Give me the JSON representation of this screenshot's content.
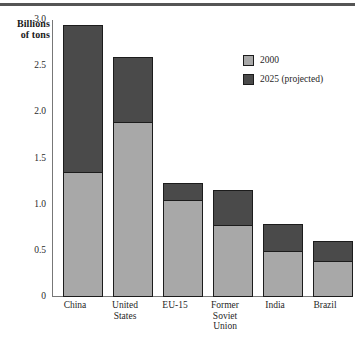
{
  "chart_data": {
    "type": "bar",
    "subtype": "stacked-vertical",
    "title": "",
    "xlabel": "",
    "ylabel": "Billions of tons",
    "ylabel_lines": [
      "Billions",
      "of tons"
    ],
    "categories": [
      "China",
      "United States",
      "EU-15",
      "Former Soviet Union",
      "India",
      "Brazil"
    ],
    "category_lines": [
      [
        "China"
      ],
      [
        "United",
        "States"
      ],
      [
        "EU-15"
      ],
      [
        "Former",
        "Soviet",
        "Union"
      ],
      [
        "India"
      ],
      [
        "Brazil"
      ]
    ],
    "series": [
      {
        "name": "2000",
        "color": "#a8a8a8",
        "values": [
          1.35,
          1.9,
          1.05,
          0.78,
          0.5,
          0.39
        ]
      },
      {
        "name": "2025 (projected)",
        "color": "#4a4a4a",
        "values": [
          1.6,
          0.7,
          0.18,
          0.38,
          0.29,
          0.22
        ]
      }
    ],
    "totals": [
      2.95,
      2.6,
      1.23,
      1.16,
      0.79,
      0.61
    ],
    "ylim": [
      0,
      3.0
    ],
    "yticks": [
      0,
      0.5,
      1.0,
      1.5,
      2.0,
      2.5,
      3.0
    ],
    "ytick_labels": [
      "0",
      "0.5",
      "1.0",
      "1.5",
      "2.0",
      "2.5",
      "3.0"
    ],
    "grid": false,
    "legend_position": "top-right",
    "legend": [
      {
        "label": "2000",
        "color": "#a8a8a8"
      },
      {
        "label": "2025 (projected)",
        "color": "#4a4a4a"
      }
    ]
  },
  "colors": {
    "series_2000": "#a8a8a8",
    "series_2025": "#4a4a4a",
    "outline": "#1c1c1c",
    "axis": "#777777",
    "top_rule": "#555555",
    "background": "#ffffff"
  }
}
